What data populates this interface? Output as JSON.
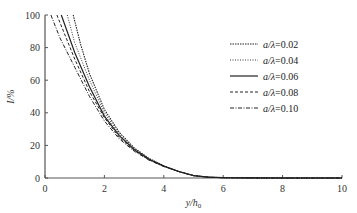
{
  "chart_data": {
    "type": "line",
    "title": "",
    "xlabel": "y/h0",
    "xlabel_parts": {
      "main": "y/h",
      "sub": "0"
    },
    "ylabel": "I/%",
    "xlim": [
      0,
      10
    ],
    "ylim": [
      0,
      100
    ],
    "xticks": [
      0,
      2,
      4,
      6,
      8,
      10
    ],
    "yticks": [
      0,
      20,
      40,
      60,
      80,
      100
    ],
    "grid": false,
    "legend_position": "top-right",
    "series": [
      {
        "name": "a/λ=0.02",
        "label_prefix": "a/λ",
        "label_value": "=0.02",
        "style": "dotted-dense",
        "x": [
          0.95,
          1.2,
          1.5,
          2.0,
          2.5,
          3.0,
          3.5,
          4.0,
          4.5,
          5.0,
          5.5,
          6.0,
          7.0,
          8.0,
          10.0
        ],
        "y": [
          100,
          82,
          64,
          42,
          28,
          18.5,
          12,
          7.5,
          4,
          1.5,
          0.5,
          0.2,
          0.05,
          0,
          0
        ]
      },
      {
        "name": "a/λ=0.04",
        "label_prefix": "a/λ",
        "label_value": "=0.04",
        "style": "dotted-fine",
        "x": [
          0.75,
          1.0,
          1.5,
          2.0,
          2.5,
          3.0,
          3.5,
          4.0,
          4.5,
          5.0,
          5.5,
          6.0,
          7.0,
          8.0,
          10.0
        ],
        "y": [
          100,
          83,
          60,
          40,
          27,
          18,
          12,
          7.5,
          4,
          1.5,
          0.5,
          0.2,
          0.05,
          0,
          0
        ]
      },
      {
        "name": "a/λ=0.06",
        "label_prefix": "a/λ",
        "label_value": "=0.06",
        "style": "solid",
        "x": [
          0.55,
          1.0,
          1.5,
          2.0,
          2.5,
          3.0,
          3.5,
          4.0,
          4.5,
          5.0,
          5.5,
          6.0,
          7.0,
          8.0,
          10.0
        ],
        "y": [
          100,
          77,
          56,
          38,
          26,
          17.5,
          11.5,
          7.3,
          4,
          1.5,
          0.5,
          0.2,
          0.05,
          0,
          0
        ]
      },
      {
        "name": "a/λ=0.08",
        "label_prefix": "a/λ",
        "label_value": "=0.08",
        "style": "dashed",
        "x": [
          0.4,
          1.0,
          1.5,
          2.0,
          2.5,
          3.0,
          3.5,
          4.0,
          4.5,
          5.0,
          5.5,
          6.0,
          7.0,
          8.0,
          10.0
        ],
        "y": [
          100,
          73,
          53,
          37,
          25,
          17,
          11.3,
          7.2,
          4,
          1.5,
          0.5,
          0.2,
          0.05,
          0,
          0
        ]
      },
      {
        "name": "a/λ=0.10",
        "label_prefix": "a/λ",
        "label_value": "=0.10",
        "style": "dash-dot",
        "x": [
          0.2,
          0.5,
          1.0,
          1.5,
          2.0,
          2.5,
          3.0,
          3.5,
          4.0,
          4.5,
          5.0,
          5.5,
          6.0,
          7.0,
          8.0,
          10.0
        ],
        "y": [
          100,
          86,
          68,
          50,
          35,
          24,
          16.5,
          11,
          7,
          4,
          1.5,
          0.5,
          0.2,
          0.05,
          0,
          0
        ]
      }
    ]
  }
}
